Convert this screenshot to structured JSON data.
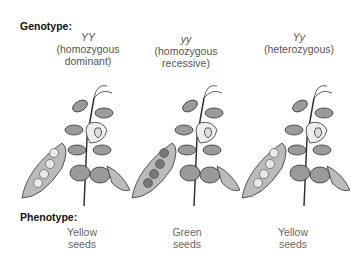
{
  "genotype_heading": "Genotype:",
  "phenotype_heading": "Phenotype:",
  "columns": [
    {
      "genotype": "YY",
      "description_line1": "(homozygous",
      "description_line2": "dominant)",
      "phenotype_line1": "Yellow",
      "phenotype_line2": "seeds",
      "seed_color": "#e8e8e8"
    },
    {
      "genotype": "yy",
      "description_line1": "(homozygous",
      "description_line2": "recessive)",
      "phenotype_line1": "Green",
      "phenotype_line2": "seeds",
      "seed_color": "#777777"
    },
    {
      "genotype": "Yy",
      "description_line1": "(heterozygous)",
      "description_line2": "",
      "phenotype_line1": "Yellow",
      "phenotype_line2": "seeds",
      "seed_color": "#e8e8e8"
    }
  ]
}
